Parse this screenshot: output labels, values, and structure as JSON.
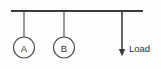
{
  "diagram": {
    "background_color": "#fdfdfd",
    "stroke_color": "#3a3a3a",
    "beam": {
      "name": "horizontal-beam",
      "x1": 11,
      "y1": 11,
      "x2": 143,
      "y2": 11,
      "thickness": 2.2,
      "color": "#3a3a3a"
    },
    "nodes": [
      {
        "label": "A",
        "hanger_x": 24,
        "hanger_top_y": 11,
        "hanger_bottom_y": 37,
        "circle_cx": 24,
        "circle_cy": 47.5,
        "circle_r": 10.5,
        "color": "#4a4a4a"
      },
      {
        "label": "B",
        "hanger_x": 64,
        "hanger_top_y": 11,
        "hanger_bottom_y": 37,
        "circle_cx": 64,
        "circle_cy": 47.5,
        "circle_r": 10.5,
        "color": "#4a4a4a"
      }
    ],
    "load": {
      "label": "Load",
      "arrow_x": 122,
      "arrow_top_y": 11,
      "arrow_shaft_bottom_y": 50,
      "arrow_tip_y": 56.5,
      "arrow_half_width": 3.2,
      "label_x": 129,
      "label_y": 48,
      "color": "#3c3c3c"
    }
  }
}
